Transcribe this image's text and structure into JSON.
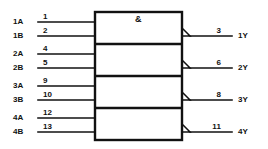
{
  "diagram": {
    "qualifier": "&",
    "line_color": "#111111",
    "background": "#ffffff",
    "gates": [
      {
        "id": "gate-1",
        "inputs": [
          {
            "name": "1A",
            "pin": "1"
          },
          {
            "name": "1B",
            "pin": "2"
          }
        ],
        "output": {
          "name": "1Y",
          "pin": "3"
        }
      },
      {
        "id": "gate-2",
        "inputs": [
          {
            "name": "2A",
            "pin": "4"
          },
          {
            "name": "2B",
            "pin": "5"
          }
        ],
        "output": {
          "name": "2Y",
          "pin": "6"
        }
      },
      {
        "id": "gate-3",
        "inputs": [
          {
            "name": "3A",
            "pin": "9"
          },
          {
            "name": "3B",
            "pin": "10"
          }
        ],
        "output": {
          "name": "3Y",
          "pin": "8"
        }
      },
      {
        "id": "gate-4",
        "inputs": [
          {
            "name": "4A",
            "pin": "12"
          },
          {
            "name": "4B",
            "pin": "13"
          }
        ],
        "output": {
          "name": "4Y",
          "pin": "11"
        }
      }
    ]
  }
}
